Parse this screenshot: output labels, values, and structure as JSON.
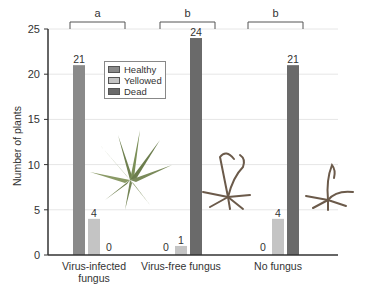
{
  "chart_data": {
    "type": "bar",
    "title": "",
    "xlabel": "",
    "ylabel": "Number of plants",
    "ylim": [
      0,
      25
    ],
    "yticks": [
      0,
      5,
      10,
      15,
      20,
      25
    ],
    "grid": true,
    "legend_position": "upper-left-inside",
    "categories": [
      "Virus-infected fungus",
      "Virus-free fungus",
      "No fungus"
    ],
    "category_lines": [
      [
        "Virus-infected",
        "fungus"
      ],
      [
        "Virus-free fungus"
      ],
      [
        "No fungus"
      ]
    ],
    "series": [
      {
        "name": "Healthy",
        "values": [
          21,
          0,
          0
        ],
        "color": "#8a8a8a"
      },
      {
        "name": "Yellowed",
        "values": [
          4,
          1,
          4
        ],
        "color": "#c4c4c4"
      },
      {
        "name": "Dead",
        "values": [
          0,
          24,
          21
        ],
        "color": "#6a6a6a"
      }
    ],
    "significance_groups": [
      "a",
      "b",
      "b"
    ],
    "annotations": [
      "Illustration of healthy plant near Virus-infected fungus group",
      "Illustrations of dead plants near Virus-free fungus and No fungus groups"
    ]
  },
  "legend": {
    "items": [
      {
        "label": "Healthy",
        "color": "#8a8a8a"
      },
      {
        "label": "Yellowed",
        "color": "#c4c4c4"
      },
      {
        "label": "Dead",
        "color": "#6a6a6a"
      }
    ]
  }
}
